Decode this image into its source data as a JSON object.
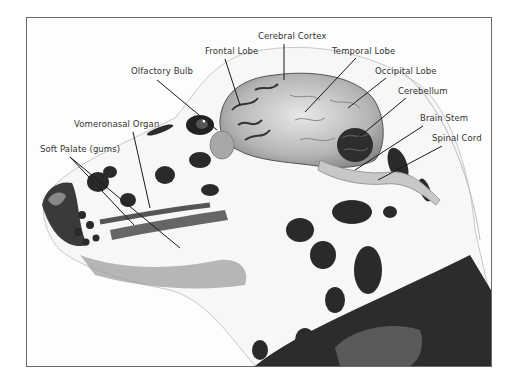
{
  "illustration": {
    "subject": "Dalmatian head anatomical cross-section showing brain and olfactory structures",
    "colors": {
      "frame_border": "#6a6a6a",
      "label_text": "#333333",
      "leader_line": "#1a1a1a",
      "spots": "#2a2a2a",
      "brain": "#b9b9b9",
      "collar": "#2c2c2c"
    }
  },
  "labels": {
    "cerebral_cortex": "Cerebral Cortex",
    "frontal_lobe": "Frontal Lobe",
    "olfactory_bulb": "Olfactory Bulb",
    "temporal_lobe": "Temporal Lobe",
    "occipital_lobe": "Occipital Lobe",
    "cerebellum": "Cerebellum",
    "brain_stem": "Brain Stem",
    "spinal_cord": "Spinal Cord",
    "vomeronasal_organ": "Vomeronasal Organ",
    "soft_palate": "Soft Palate (gums)"
  }
}
